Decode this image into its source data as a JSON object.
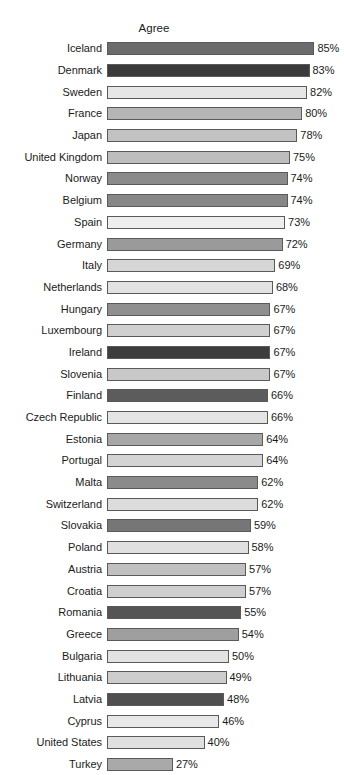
{
  "chart_data": {
    "type": "bar",
    "orientation": "horizontal",
    "title": "Agree",
    "xlabel": "",
    "ylabel": "",
    "xlim": [
      0,
      85
    ],
    "grid": false,
    "legend": null,
    "value_suffix": "%",
    "categories": [
      "Iceland",
      "Denmark",
      "Sweden",
      "France",
      "Japan",
      "United Kingdom",
      "Norway",
      "Belgium",
      "Spain",
      "Germany",
      "Italy",
      "Netherlands",
      "Hungary",
      "Luxembourg",
      "Ireland",
      "Slovenia",
      "Finland",
      "Czech Republic",
      "Estonia",
      "Portugal",
      "Malta",
      "Switzerland",
      "Slovakia",
      "Poland",
      "Austria",
      "Croatia",
      "Romania",
      "Greece",
      "Bulgaria",
      "Lithuania",
      "Latvia",
      "Cyprus",
      "United States",
      "Turkey"
    ],
    "values": [
      85,
      83,
      82,
      80,
      78,
      75,
      74,
      74,
      73,
      72,
      69,
      68,
      67,
      67,
      67,
      67,
      66,
      66,
      64,
      64,
      62,
      62,
      59,
      58,
      57,
      57,
      55,
      54,
      50,
      49,
      48,
      46,
      40,
      27
    ],
    "bar_colors": [
      "#6b6b6b",
      "#3b3b3b",
      "#e6e6e6",
      "#b5b5b5",
      "#c2c2c2",
      "#bdbdbd",
      "#8a8a8a",
      "#878787",
      "#eeeeee",
      "#9a9a9a",
      "#d6d6d6",
      "#e2e2e2",
      "#8f8f8f",
      "#d0d0d0",
      "#3d3d3d",
      "#c8c8c8",
      "#5c5c5c",
      "#e4e4e4",
      "#a7a7a7",
      "#d4d4d4",
      "#8b8b8b",
      "#dcdcdc",
      "#767676",
      "#e0e0e0",
      "#c0c0c0",
      "#cfcfcf",
      "#555555",
      "#9f9f9f",
      "#e2e2e2",
      "#cdcdcd",
      "#4f4f4f",
      "#e8e8e8",
      "#e0e0e0",
      "#a9a9a9"
    ],
    "bars": [
      {
        "label": "Iceland",
        "value": 85,
        "value_label": "85%",
        "color": "#6b6b6b"
      },
      {
        "label": "Denmark",
        "value": 83,
        "value_label": "83%",
        "color": "#3b3b3b"
      },
      {
        "label": "Sweden",
        "value": 82,
        "value_label": "82%",
        "color": "#e6e6e6"
      },
      {
        "label": "France",
        "value": 80,
        "value_label": "80%",
        "color": "#b5b5b5"
      },
      {
        "label": "Japan",
        "value": 78,
        "value_label": "78%",
        "color": "#c2c2c2"
      },
      {
        "label": "United Kingdom",
        "value": 75,
        "value_label": "75%",
        "color": "#bdbdbd"
      },
      {
        "label": "Norway",
        "value": 74,
        "value_label": "74%",
        "color": "#8a8a8a"
      },
      {
        "label": "Belgium",
        "value": 74,
        "value_label": "74%",
        "color": "#878787"
      },
      {
        "label": "Spain",
        "value": 73,
        "value_label": "73%",
        "color": "#eeeeee"
      },
      {
        "label": "Germany",
        "value": 72,
        "value_label": "72%",
        "color": "#9a9a9a"
      },
      {
        "label": "Italy",
        "value": 69,
        "value_label": "69%",
        "color": "#d6d6d6"
      },
      {
        "label": "Netherlands",
        "value": 68,
        "value_label": "68%",
        "color": "#e2e2e2"
      },
      {
        "label": "Hungary",
        "value": 67,
        "value_label": "67%",
        "color": "#8f8f8f"
      },
      {
        "label": "Luxembourg",
        "value": 67,
        "value_label": "67%",
        "color": "#d0d0d0"
      },
      {
        "label": "Ireland",
        "value": 67,
        "value_label": "67%",
        "color": "#3d3d3d"
      },
      {
        "label": "Slovenia",
        "value": 67,
        "value_label": "67%",
        "color": "#c8c8c8"
      },
      {
        "label": "Finland",
        "value": 66,
        "value_label": "66%",
        "color": "#5c5c5c"
      },
      {
        "label": "Czech Republic",
        "value": 66,
        "value_label": "66%",
        "color": "#e4e4e4"
      },
      {
        "label": "Estonia",
        "value": 64,
        "value_label": "64%",
        "color": "#a7a7a7"
      },
      {
        "label": "Portugal",
        "value": 64,
        "value_label": "64%",
        "color": "#d4d4d4"
      },
      {
        "label": "Malta",
        "value": 62,
        "value_label": "62%",
        "color": "#8b8b8b"
      },
      {
        "label": "Switzerland",
        "value": 62,
        "value_label": "62%",
        "color": "#dcdcdc"
      },
      {
        "label": "Slovakia",
        "value": 59,
        "value_label": "59%",
        "color": "#767676"
      },
      {
        "label": "Poland",
        "value": 58,
        "value_label": "58%",
        "color": "#e0e0e0"
      },
      {
        "label": "Austria",
        "value": 57,
        "value_label": "57%",
        "color": "#c0c0c0"
      },
      {
        "label": "Croatia",
        "value": 57,
        "value_label": "57%",
        "color": "#cfcfcf"
      },
      {
        "label": "Romania",
        "value": 55,
        "value_label": "55%",
        "color": "#555555"
      },
      {
        "label": "Greece",
        "value": 54,
        "value_label": "54%",
        "color": "#9f9f9f"
      },
      {
        "label": "Bulgaria",
        "value": 50,
        "value_label": "50%",
        "color": "#e2e2e2"
      },
      {
        "label": "Lithuania",
        "value": 49,
        "value_label": "49%",
        "color": "#cdcdcd"
      },
      {
        "label": "Latvia",
        "value": 48,
        "value_label": "48%",
        "color": "#4f4f4f"
      },
      {
        "label": "Cyprus",
        "value": 46,
        "value_label": "46%",
        "color": "#e8e8e8"
      },
      {
        "label": "United States",
        "value": 40,
        "value_label": "40%",
        "color": "#e0e0e0"
      },
      {
        "label": "Turkey",
        "value": 27,
        "value_label": "27%",
        "color": "#a9a9a9"
      }
    ]
  },
  "layout": {
    "px_per_unit": 2.44,
    "bar_border_color": "#5a5a5a"
  }
}
